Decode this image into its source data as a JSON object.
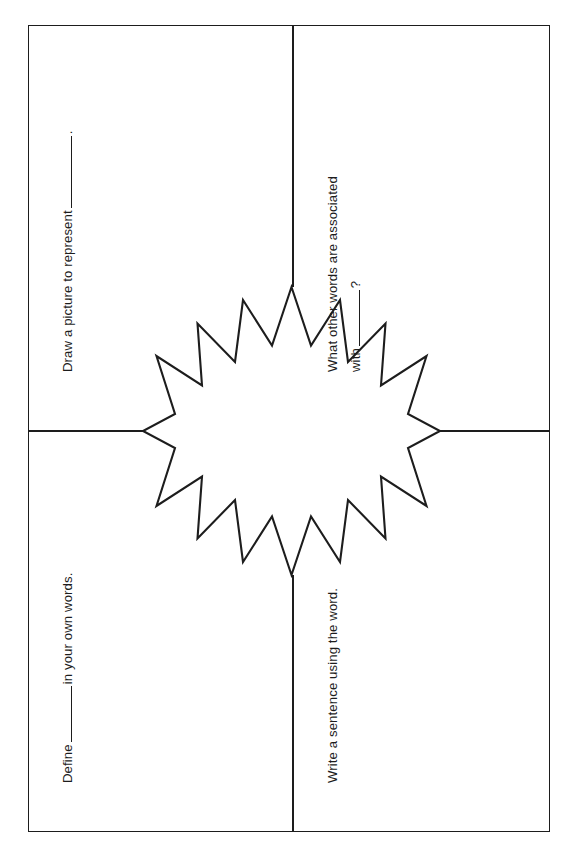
{
  "document": {
    "type": "vocabulary-worksheet",
    "title": "Vocabulary Four-Square Starburst Worksheet",
    "orientation": "portrait",
    "ink_color": "#1d1d1d",
    "background_color": "#ffffff"
  },
  "frame": {
    "border_color": "#1d1d1d",
    "border_width_px": 1.6
  },
  "center_shape": {
    "name": "starburst",
    "points": 16,
    "fill": "#ffffff",
    "stroke": "#1d1d1d",
    "stroke_width_px": 1.8,
    "label": ""
  },
  "dividers": {
    "color": "#1d1d1d",
    "width_px": 1.8,
    "arms": [
      "top",
      "bottom",
      "left",
      "right"
    ]
  },
  "quadrants": [
    {
      "id": "draw",
      "position": "upper-left",
      "text_rotation_deg": -90,
      "prompt_parts": [
        "Draw a picture to represent ",
        "",
        "."
      ],
      "prompt_full": "Draw a picture to represent ______.",
      "prefix": "Draw a picture to represent",
      "suffix": ".",
      "blank": "",
      "answer": ""
    },
    {
      "id": "associated",
      "position": "upper-right",
      "text_rotation_deg": -90,
      "prompt_parts": [
        "What other words are associated",
        "with ",
        "",
        "?"
      ],
      "prompt_full": "What other words are associated with ______?",
      "line1": "What other words are associated",
      "line2_prefix": "with",
      "line2_suffix": "?",
      "blank": "",
      "answer": ""
    },
    {
      "id": "define",
      "position": "lower-left",
      "text_rotation_deg": -90,
      "prompt_parts": [
        "Define ",
        "",
        " in your own words."
      ],
      "prompt_full": "Define ______ in your own words.",
      "prefix": "Define",
      "suffix": "in your own words.",
      "blank": "",
      "answer": ""
    },
    {
      "id": "sentence",
      "position": "lower-right",
      "text_rotation_deg": -90,
      "prompt_parts": [
        "Write a sentence using the word."
      ],
      "prompt_full": "Write a sentence using the word.",
      "prefix": "Write a sentence using the word.",
      "suffix": "",
      "blank": null,
      "answer": ""
    }
  ]
}
